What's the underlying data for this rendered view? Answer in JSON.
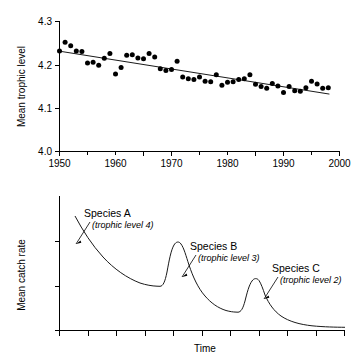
{
  "figure": {
    "background": "#ffffff",
    "ink": "#000000"
  },
  "chart_data": [
    {
      "type": "scatter",
      "panel": "top",
      "title": "",
      "xlabel": "",
      "ylabel": "Mean trophic level",
      "xlim": [
        1950,
        2000
      ],
      "ylim": [
        4.0,
        4.3
      ],
      "grid": false,
      "legend": "none",
      "xticks": [
        1950,
        1960,
        1970,
        1980,
        1990,
        2000
      ],
      "xtick_labels": [
        "1950",
        "1960",
        "1970",
        "1980",
        "1990",
        "2000"
      ],
      "xminorticks": [
        1955,
        1965,
        1975,
        1985,
        1995
      ],
      "yticks": [
        4.0,
        4.1,
        4.2,
        4.3
      ],
      "ytick_labels": [
        "4.0",
        "4.1",
        "4.2",
        "4.3"
      ],
      "x": [
        1950,
        1951,
        1952,
        1953,
        1954,
        1955,
        1956,
        1957,
        1958,
        1959,
        1960,
        1961,
        1962,
        1963,
        1964,
        1965,
        1966,
        1967,
        1968,
        1969,
        1970,
        1971,
        1972,
        1973,
        1974,
        1975,
        1976,
        1977,
        1978,
        1979,
        1980,
        1981,
        1982,
        1983,
        1984,
        1985,
        1986,
        1987,
        1988,
        1989,
        1990,
        1991,
        1992,
        1993,
        1994,
        1995,
        1996,
        1997,
        1998
      ],
      "y": [
        4.232,
        4.252,
        4.244,
        4.232,
        4.231,
        4.204,
        4.206,
        4.199,
        4.215,
        4.226,
        4.179,
        4.194,
        4.222,
        4.223,
        4.216,
        4.214,
        4.226,
        4.218,
        4.191,
        4.187,
        4.189,
        4.208,
        4.172,
        4.168,
        4.166,
        4.172,
        4.162,
        4.161,
        4.177,
        4.153,
        4.16,
        4.161,
        4.166,
        4.168,
        4.177,
        4.155,
        4.15,
        4.146,
        4.157,
        4.151,
        4.136,
        4.15,
        4.14,
        4.139,
        4.147,
        4.162,
        4.156,
        4.146,
        4.147
      ],
      "trend": {
        "label": "linear regression",
        "x0": 1950,
        "y0": 4.2315,
        "x1": 1998.2,
        "y1": 4.1325
      }
    },
    {
      "type": "line",
      "panel": "bottom",
      "title": "",
      "xlabel": "Time",
      "ylabel": "Mean catch rate",
      "grid": false,
      "legend": "none",
      "xticks_unlabeled": 10,
      "yticks_unlabeled": 3,
      "series_name": "sequential fishery depletion",
      "description": "Successive decaying peaks: each trophic level is fished down, then the next lower level is exploited.",
      "annotations": [
        {
          "id": "a",
          "title": "Species A",
          "subtitle": "(trophic level 4)"
        },
        {
          "id": "b",
          "title": "Species B",
          "subtitle": "(trophic level 3)"
        },
        {
          "id": "c",
          "title": "Species C",
          "subtitle": "(trophic level 2)"
        }
      ]
    }
  ]
}
